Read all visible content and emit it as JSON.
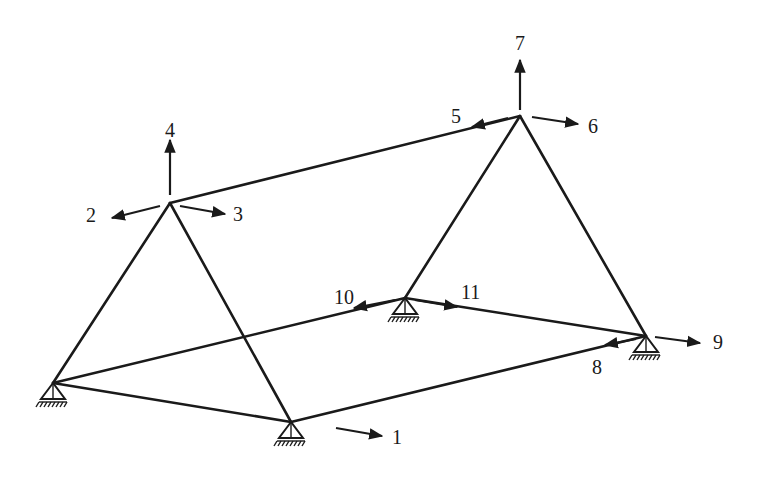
{
  "diagram": {
    "title": "",
    "type": "3D frame with degrees of freedom",
    "colors": {
      "ink": "#1a1a1a",
      "background": "#ffffff"
    },
    "nodes": [
      {
        "id": "A",
        "x": 170,
        "y": 203,
        "desc": "left apex"
      },
      {
        "id": "B",
        "x": 520,
        "y": 116,
        "desc": "right apex"
      },
      {
        "id": "C",
        "x": 53,
        "y": 383,
        "desc": "front-left support"
      },
      {
        "id": "D",
        "x": 291,
        "y": 422,
        "desc": "front-right support"
      },
      {
        "id": "E",
        "x": 405,
        "y": 298,
        "desc": "back-left support"
      },
      {
        "id": "F",
        "x": 646,
        "y": 336,
        "desc": "back-right support"
      }
    ],
    "dof_labels": [
      {
        "id": "1",
        "label": "1",
        "x": 392,
        "y": 444
      },
      {
        "id": "2",
        "label": "2",
        "x": 86,
        "y": 222
      },
      {
        "id": "3",
        "label": "3",
        "x": 233,
        "y": 221
      },
      {
        "id": "4",
        "label": "4",
        "x": 165,
        "y": 137
      },
      {
        "id": "5",
        "label": "5",
        "x": 451,
        "y": 123
      },
      {
        "id": "6",
        "label": "6",
        "x": 588,
        "y": 133
      },
      {
        "id": "7",
        "label": "7",
        "x": 515,
        "y": 50
      },
      {
        "id": "8",
        "label": "8",
        "x": 592,
        "y": 374
      },
      {
        "id": "9",
        "label": "9",
        "x": 713,
        "y": 349
      },
      {
        "id": "10",
        "label": "10",
        "x": 334,
        "y": 304
      },
      {
        "id": "11",
        "label": "11",
        "x": 461,
        "y": 299
      }
    ]
  }
}
